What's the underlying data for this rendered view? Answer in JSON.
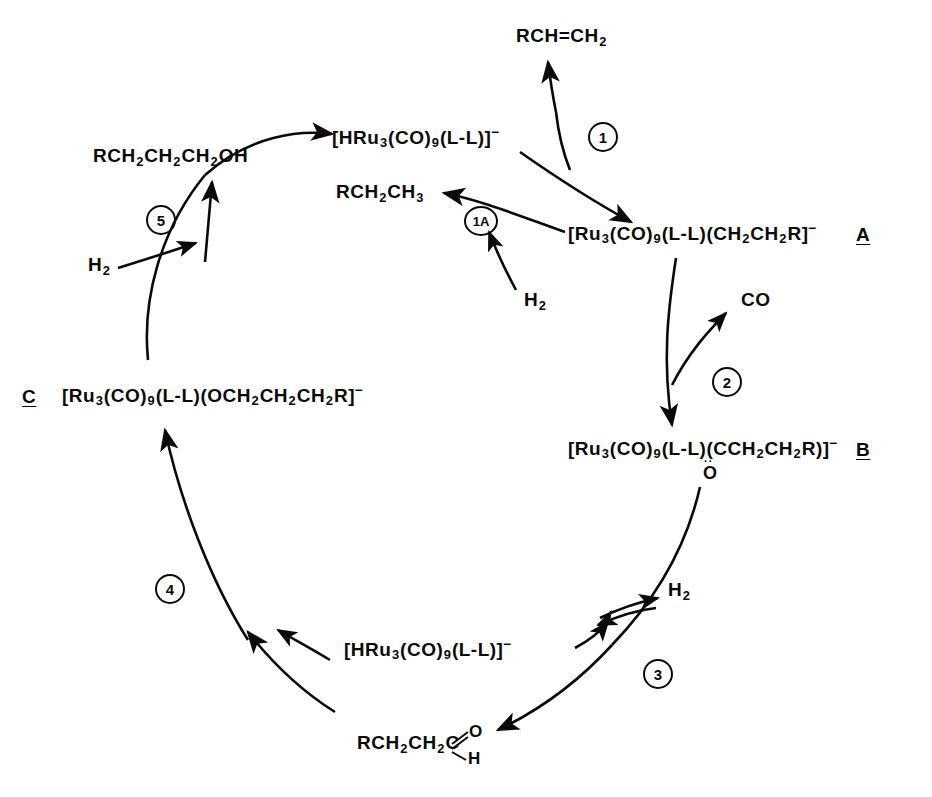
{
  "diagram": {
    "type": "catalytic-cycle",
    "species": {
      "hydride_top": "[HRu3(CO)9(L-L)]−",
      "hydride_bottom": "[HRu3(CO)9(L-L)]−",
      "A": "[Ru3(CO)9(L-L)(CH2CH2R]−",
      "A_letter": "A",
      "B": "[Ru3(CO)9(L-L)(CCH2CH2R)]−",
      "B_carbonyl_oxygen": "O",
      "B_letter": "B",
      "C": "[Ru3(CO)9(L-L)(OCH2CH2CH2R]−",
      "C_letter": "C"
    },
    "reagents": {
      "alkene": "RCH=CH2",
      "alkane": "RCH2CH3",
      "alcohol": "RCH2CH2CH2OH",
      "aldehyde_chain": "RCH2CH2C",
      "aldehyde_oxygen": "O",
      "aldehyde_hydrogen": "H",
      "carbon_monoxide": "CO",
      "dihydrogen_step1a": "H2",
      "dihydrogen_step3": "H2",
      "dihydrogen_step5": "H2"
    },
    "steps": [
      {
        "id": "1",
        "label": "1",
        "x": 588,
        "y": 122
      },
      {
        "id": "1A",
        "label": "1A",
        "x": 464,
        "y": 206
      },
      {
        "id": "2",
        "label": "2",
        "x": 712,
        "y": 367
      },
      {
        "id": "3",
        "label": "3",
        "x": 643,
        "y": 659
      },
      {
        "id": "4",
        "label": "4",
        "x": 155,
        "y": 574
      },
      {
        "id": "5",
        "label": "5",
        "x": 146,
        "y": 205
      }
    ],
    "colors": {
      "ink": "#0a0a0a",
      "background": "#ffffff"
    }
  }
}
